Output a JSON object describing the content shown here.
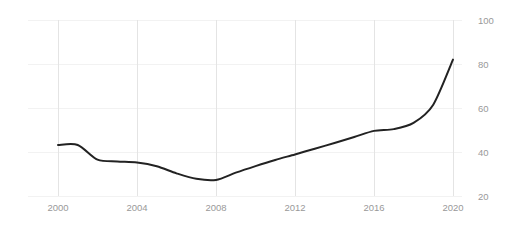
{
  "chart_data": {
    "type": "line",
    "title": "",
    "subtitle": "",
    "xlabel": "",
    "ylabel": "",
    "xlim": [
      1999.2,
      2021.0
    ],
    "ylim": [
      20,
      100
    ],
    "grid": true,
    "legend": null,
    "legend_position": "none",
    "line_color": "#222222",
    "grid_color_h": "#f2f2f2",
    "grid_color_v": "#e4e4e4",
    "tick_color": "#999999",
    "background": "#ffffff",
    "x_ticks": [
      2000,
      2004,
      2008,
      2012,
      2016,
      2020
    ],
    "x_tick_labels": [
      "2000",
      "2004",
      "2008",
      "2012",
      "2016",
      "2020"
    ],
    "y_ticks": [
      20,
      40,
      60,
      80,
      100
    ],
    "y_tick_labels": [
      "20",
      "40",
      "60",
      "80",
      "100"
    ],
    "series": [
      {
        "name": "value",
        "x": [
          2000,
          2001,
          2002,
          2003,
          2004,
          2005,
          2006,
          2007,
          2008,
          2009,
          2010,
          2011,
          2012,
          2013,
          2014,
          2015,
          2016,
          2017,
          2018,
          2019,
          2020
        ],
        "values": [
          43.2,
          43.2,
          36.5,
          35.7,
          35.2,
          33.5,
          30.3,
          27.8,
          27.3,
          30.6,
          33.6,
          36.4,
          38.9,
          41.5,
          44.1,
          46.8,
          49.6,
          50.4,
          53.2,
          61.5,
          82.0
        ]
      }
    ]
  }
}
